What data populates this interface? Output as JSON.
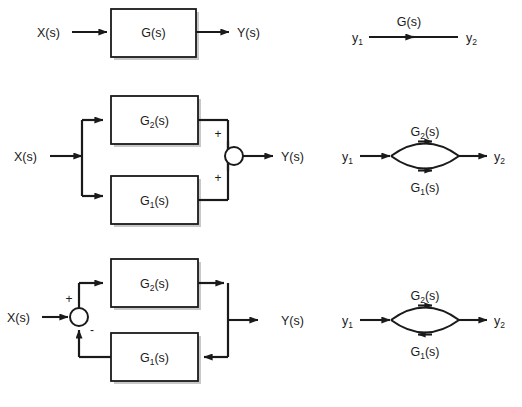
{
  "figure": {
    "background": "#ffffff",
    "line_color": "#1a1a1a",
    "block_fill": "#ffffff",
    "shadow_color": "#9a9a9a"
  },
  "rows": [
    {
      "id": "row-cascade",
      "block_diagram": {
        "input_label": "X(s)",
        "output_label": "Y(s)",
        "blocks": [
          {
            "label": "G(s)",
            "base": "G",
            "sub": "",
            "tail": "(s)"
          }
        ],
        "junction": null
      },
      "signal_flow_graph": {
        "source_node": "y",
        "source_sub": "1",
        "sink_node": "y",
        "sink_sub": "2",
        "branches": [
          {
            "label_base": "G",
            "label_sub": "",
            "label_tail": "(s)",
            "direction": "forward",
            "position": "top"
          }
        ]
      }
    },
    {
      "id": "row-parallel",
      "block_diagram": {
        "input_label": "X(s)",
        "output_label": "Y(s)",
        "blocks": [
          {
            "label": "G2(s)",
            "base": "G",
            "sub": "2",
            "tail": "(s)"
          },
          {
            "label": "G1(s)",
            "base": "G",
            "sub": "1",
            "tail": "(s)"
          }
        ],
        "junction": {
          "top_sign": "+",
          "bottom_sign": "+"
        }
      },
      "signal_flow_graph": {
        "source_node": "y",
        "source_sub": "1",
        "sink_node": "y",
        "sink_sub": "2",
        "branches": [
          {
            "label_base": "G",
            "label_sub": "2",
            "label_tail": "(s)",
            "direction": "forward",
            "position": "top"
          },
          {
            "label_base": "G",
            "label_sub": "1",
            "label_tail": "(s)",
            "direction": "forward",
            "position": "bottom"
          }
        ]
      }
    },
    {
      "id": "row-feedback",
      "block_diagram": {
        "input_label": "X(s)",
        "output_label": "Y(s)",
        "blocks": [
          {
            "label": "G2(s)",
            "base": "G",
            "sub": "2",
            "tail": "(s)"
          },
          {
            "label": "G1(s)",
            "base": "G",
            "sub": "1",
            "tail": "(s)"
          }
        ],
        "junction": {
          "top_sign": "+",
          "bottom_sign": "-"
        }
      },
      "signal_flow_graph": {
        "source_node": "y",
        "source_sub": "1",
        "sink_node": "y",
        "sink_sub": "2",
        "branches": [
          {
            "label_base": "G",
            "label_sub": "2",
            "label_tail": "(s)",
            "direction": "forward",
            "position": "top"
          },
          {
            "label_base": "G",
            "label_sub": "1",
            "label_tail": "(s)",
            "direction": "reverse",
            "position": "bottom"
          }
        ]
      }
    }
  ]
}
